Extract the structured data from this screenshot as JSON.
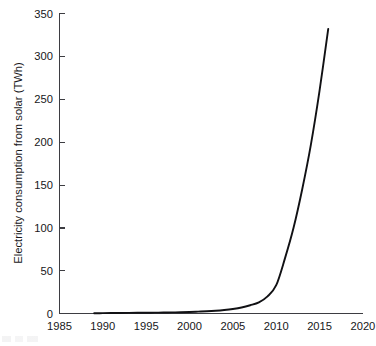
{
  "chart_data": {
    "type": "line",
    "title": "",
    "subtitle": "",
    "xlabel": "",
    "ylabel": "Electricity consumption from solar (TWh)",
    "xlim": [
      1985,
      2020
    ],
    "ylim": [
      0,
      350
    ],
    "xticks": [
      1985,
      1990,
      1995,
      2000,
      2005,
      2010,
      2015,
      2020
    ],
    "yticks": [
      0,
      50,
      100,
      150,
      200,
      250,
      300,
      350
    ],
    "xtick_labels": [
      "1985",
      "1990",
      "1995",
      "2000",
      "2005",
      "2010",
      "2015",
      "2020"
    ],
    "ytick_labels": [
      "0",
      "50",
      "100",
      "150",
      "200",
      "250",
      "300",
      "350"
    ],
    "grid": false,
    "legend": false,
    "legend_position": "none",
    "line_color": "#111114",
    "axis_color": "#3d3d42",
    "background_color": "#ffffff",
    "annotations": [],
    "series": [
      {
        "name": "Electricity consumption from solar",
        "x": [
          1989,
          1990,
          1991,
          1992,
          1993,
          1994,
          1995,
          1996,
          1997,
          1998,
          1999,
          2000,
          2001,
          2002,
          2003,
          2004,
          2005,
          2006,
          2007,
          2008,
          2009,
          2010,
          2011,
          2012,
          2013,
          2014,
          2015,
          2016
        ],
        "values": [
          0.3,
          0.4,
          0.5,
          0.6,
          0.7,
          0.8,
          0.9,
          1.0,
          1.1,
          1.3,
          1.5,
          1.8,
          2.2,
          2.6,
          3.2,
          4.1,
          5.3,
          7.0,
          9.6,
          13.0,
          20.0,
          33.0,
          64.0,
          100.0,
          145.0,
          197.0,
          260.0,
          332.0
        ]
      }
    ]
  }
}
